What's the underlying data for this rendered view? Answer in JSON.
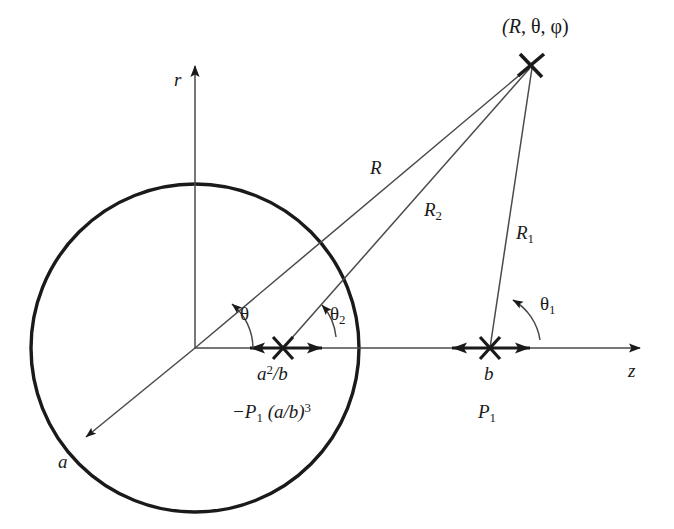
{
  "figure": {
    "type": "geometry-diagram",
    "background_color": "#ffffff",
    "stroke_color": "#1a1a1a"
  },
  "axes": {
    "vertical": {
      "label": "r",
      "direction": "up",
      "tip_x": 195,
      "tip_y": 58
    },
    "horizontal": {
      "label": "z",
      "direction": "right",
      "tip_x": 650,
      "tip_y": 347
    },
    "origin": {
      "x": 195,
      "y": 348
    }
  },
  "circle": {
    "center_x": 195,
    "center_y": 348,
    "radius": 164,
    "radius_label": "a",
    "radius_arrow_end_x": 81,
    "radius_arrow_end_y": 441
  },
  "field_point": {
    "label_open": "(",
    "label_R": "R",
    "label_sep1": ", ",
    "label_theta": "θ",
    "label_sep2": ", ",
    "label_phi": "φ",
    "label_close": ")",
    "label_full": "(R, θ, φ)",
    "marker": "cross-marker",
    "x": 531,
    "y": 65
  },
  "image_dipole": {
    "marker": "cross-marker",
    "x": 283,
    "y": 348,
    "position_label_base": "a",
    "position_label_sup": "2",
    "position_label_tail": "/b",
    "position_label_full": "a²/b",
    "moment_label_full": "−P₁ (a/b)³",
    "moment_prefix": "−P",
    "moment_sub": "1",
    "moment_paren": " (a/b)",
    "moment_sup": "3"
  },
  "source_dipole": {
    "marker": "cross-marker",
    "x": 490,
    "y": 348,
    "position_label": "b",
    "moment_label_base": "P",
    "moment_label_sub": "1",
    "moment_label_full": "P₁"
  },
  "rays": [
    {
      "name": "R",
      "label_base": "R",
      "label_sub": "",
      "from": "origin",
      "to": "field_point",
      "label_x": 378,
      "label_y": 170
    },
    {
      "name": "R2",
      "label_base": "R",
      "label_sub": "2",
      "from": "image_dipole",
      "to": "field_point",
      "label_x": 430,
      "label_y": 212
    },
    {
      "name": "R1",
      "label_base": "R",
      "label_sub": "1",
      "from": "source_dipole",
      "to": "field_point",
      "label_x": 522,
      "label_y": 235
    }
  ],
  "angles": [
    {
      "name": "theta",
      "label_base": "θ",
      "label_sub": "",
      "vertex": "origin",
      "label_x": 243,
      "label_y": 313
    },
    {
      "name": "theta2",
      "label_base": "θ",
      "label_sub": "2",
      "vertex": "image_dipole",
      "label_x": 333,
      "label_y": 313
    },
    {
      "name": "theta1",
      "label_base": "θ",
      "label_sub": "1",
      "vertex": "source_dipole",
      "label_x": 545,
      "label_y": 304
    }
  ]
}
